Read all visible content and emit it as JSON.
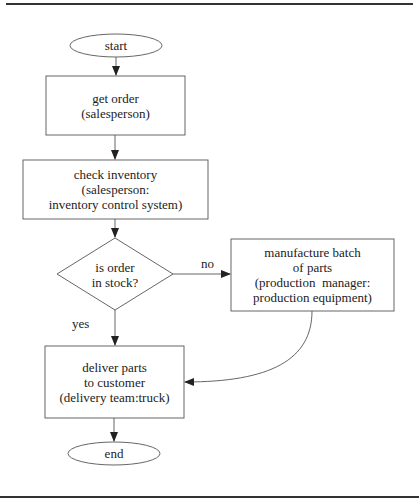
{
  "diagram": {
    "type": "flowchart",
    "nodes": [
      {
        "id": "start",
        "shape": "terminator",
        "lines": [
          "start"
        ]
      },
      {
        "id": "get_order",
        "shape": "process",
        "lines": [
          "get order",
          "(salesperson)"
        ]
      },
      {
        "id": "check_inventory",
        "shape": "process",
        "lines": [
          "check inventory",
          "(salesperson:",
          "inventory control system)"
        ]
      },
      {
        "id": "in_stock",
        "shape": "decision",
        "lines": [
          "is order",
          "in stock?"
        ]
      },
      {
        "id": "manufacture",
        "shape": "process",
        "lines": [
          "manufacture batch",
          "of parts",
          "(production  manager:",
          "production equipment)"
        ]
      },
      {
        "id": "deliver",
        "shape": "process",
        "lines": [
          "deliver parts",
          "to customer",
          "(delivery team:truck)"
        ]
      },
      {
        "id": "end",
        "shape": "terminator",
        "lines": [
          "end"
        ]
      }
    ],
    "edges": [
      {
        "from": "start",
        "to": "get_order",
        "label": ""
      },
      {
        "from": "get_order",
        "to": "check_inventory",
        "label": ""
      },
      {
        "from": "check_inventory",
        "to": "in_stock",
        "label": ""
      },
      {
        "from": "in_stock",
        "to": "manufacture",
        "label": "no"
      },
      {
        "from": "in_stock",
        "to": "deliver",
        "label": "yes"
      },
      {
        "from": "manufacture",
        "to": "deliver",
        "label": ""
      },
      {
        "from": "deliver",
        "to": "end",
        "label": ""
      }
    ]
  },
  "colors": {
    "stroke": "#555555",
    "text": "#222222",
    "background": "#ffffff"
  }
}
